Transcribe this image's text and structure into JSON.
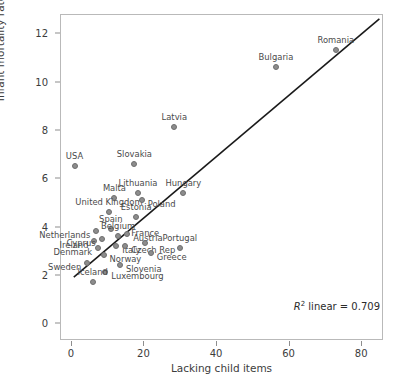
{
  "chart_data": {
    "type": "scatter",
    "title": "",
    "xlabel": "Lacking child items",
    "ylabel": "Infant mortality rate",
    "xlim": [
      -3,
      86
    ],
    "ylim": [
      -0.7,
      12.8
    ],
    "xticks": [
      0,
      20,
      40,
      60,
      80
    ],
    "yticks": [
      0,
      2,
      4,
      6,
      8,
      10,
      12
    ],
    "grid": false,
    "legend": null,
    "annotation": "R² linear = 0.709",
    "r_squared": 0.709,
    "trendline": {
      "type": "linear",
      "x_start": 0.8,
      "y_start": 1.9,
      "x_end": 85.0,
      "y_end": 12.6
    },
    "points": [
      {
        "label": "USA",
        "x": 1.0,
        "y": 6.5
      },
      {
        "label": "Malta",
        "x": 12.0,
        "y": 5.2
      },
      {
        "label": "United Kingdom",
        "x": 10.5,
        "y": 4.6
      },
      {
        "label": "Netherlands",
        "x": 7.0,
        "y": 3.8
      },
      {
        "label": "Spain",
        "x": 11.0,
        "y": 3.9
      },
      {
        "label": "Ireland",
        "x": 6.5,
        "y": 3.4
      },
      {
        "label": "Cyprus",
        "x": 8.5,
        "y": 3.5
      },
      {
        "label": "Denmark",
        "x": 7.5,
        "y": 3.1
      },
      {
        "label": "Italy",
        "x": 12.5,
        "y": 3.2
      },
      {
        "label": "Norway",
        "x": 9.0,
        "y": 2.8
      },
      {
        "label": "Sweden",
        "x": 4.5,
        "y": 2.5
      },
      {
        "label": "Luxembourg",
        "x": 9.5,
        "y": 2.1
      },
      {
        "label": "Iceland",
        "x": 6.0,
        "y": 1.7
      },
      {
        "label": "Slovenia",
        "x": 13.5,
        "y": 2.4
      },
      {
        "label": "Czech Rep",
        "x": 15.0,
        "y": 3.2
      },
      {
        "label": "Belgium",
        "x": 13.0,
        "y": 3.6
      },
      {
        "label": "Austria",
        "x": 15.5,
        "y": 3.7
      },
      {
        "label": "Estonia",
        "x": 18.0,
        "y": 4.4
      },
      {
        "label": "France",
        "x": 20.5,
        "y": 3.3
      },
      {
        "label": "Greece",
        "x": 22.0,
        "y": 2.9
      },
      {
        "label": "Portugal",
        "x": 30.0,
        "y": 3.1
      },
      {
        "label": "Lithuania",
        "x": 18.5,
        "y": 5.4
      },
      {
        "label": "Poland",
        "x": 19.5,
        "y": 5.1
      },
      {
        "label": "Slovakia",
        "x": 17.5,
        "y": 6.6
      },
      {
        "label": "Hungary",
        "x": 31.0,
        "y": 5.4
      },
      {
        "label": "Latvia",
        "x": 28.5,
        "y": 8.1
      },
      {
        "label": "Bulgaria",
        "x": 56.5,
        "y": 10.6
      },
      {
        "label": "Romania",
        "x": 73.0,
        "y": 11.3
      }
    ]
  }
}
